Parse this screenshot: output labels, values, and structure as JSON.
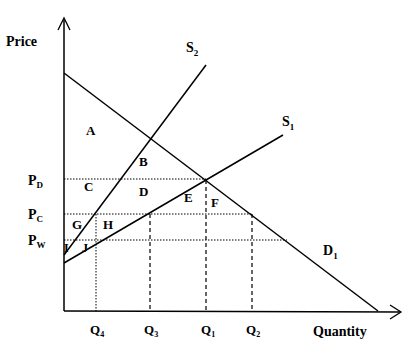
{
  "axes": {
    "y_label": "Price",
    "x_label": "Quantity"
  },
  "curves": {
    "s2": {
      "main": "S",
      "sub": "2"
    },
    "s1": {
      "main": "S",
      "sub": "1"
    },
    "d1": {
      "main": "D",
      "sub": "1"
    }
  },
  "price_levels": {
    "pd": {
      "main": "P",
      "sub": "D"
    },
    "pc": {
      "main": "P",
      "sub": "C"
    },
    "pw": {
      "main": "P",
      "sub": "W"
    }
  },
  "quantities": {
    "q4": {
      "main": "Q",
      "sub": "4"
    },
    "q3": {
      "main": "Q",
      "sub": "3"
    },
    "q1": {
      "main": "Q",
      "sub": "1"
    },
    "q2": {
      "main": "Q",
      "sub": "2"
    }
  },
  "areas": {
    "a": "A",
    "b": "B",
    "c": "C",
    "d": "D",
    "e": "E",
    "f": "F",
    "g": "G",
    "h": "H",
    "i": "I",
    "j": "J"
  },
  "colors": {
    "line": "#000000",
    "background": "#ffffff"
  }
}
